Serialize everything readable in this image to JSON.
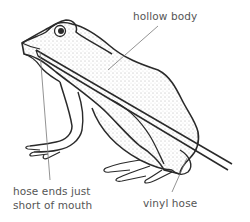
{
  "diagram": {
    "labels": {
      "hollow_body": "hollow body",
      "hose_ends_line1": "hose ends just",
      "hose_ends_line2": "short of mouth",
      "vinyl_hose": "vinyl hose"
    },
    "colors": {
      "outline": "#2a2a2a",
      "leader": "#777777",
      "text": "#555555",
      "background": "#ffffff"
    }
  }
}
